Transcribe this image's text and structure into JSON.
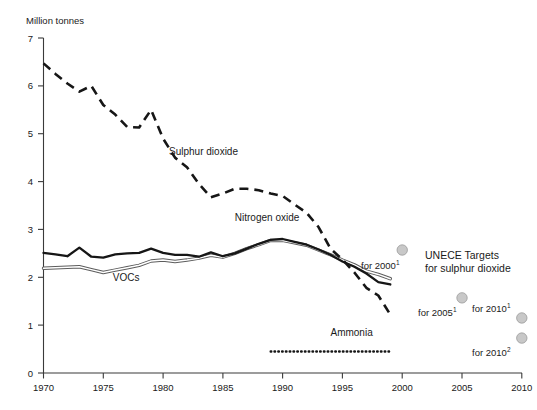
{
  "chart_data": {
    "type": "line",
    "title": "",
    "ylabel": "Million tonnes",
    "xlabel": "",
    "xlim": [
      1970,
      2010
    ],
    "ylim": [
      0,
      7
    ],
    "grid": false,
    "legend_position": "inline-annotations",
    "x_ticks": [
      "1970",
      "1975",
      "1980",
      "1985",
      "1990",
      "1995",
      "2000",
      "2005",
      "2010"
    ],
    "y_ticks": [
      "0",
      "1",
      "2",
      "3",
      "4",
      "5",
      "6",
      "7"
    ],
    "series": [
      {
        "name": "Sulphur dioxide",
        "style": "dashed",
        "color": "#161616",
        "x": [
          1970,
          1971,
          1972,
          1973,
          1974,
          1975,
          1976,
          1977,
          1978,
          1979,
          1980,
          1981,
          1982,
          1983,
          1984,
          1985,
          1986,
          1987,
          1988,
          1989,
          1990,
          1991,
          1992,
          1993,
          1994,
          1995,
          1996,
          1997,
          1998,
          1999
        ],
        "values": [
          6.47,
          6.25,
          6.05,
          5.88,
          6.0,
          5.6,
          5.4,
          5.14,
          5.13,
          5.5,
          4.9,
          4.5,
          4.3,
          3.95,
          3.67,
          3.75,
          3.85,
          3.85,
          3.82,
          3.75,
          3.7,
          3.52,
          3.35,
          3.05,
          2.6,
          2.37,
          2.1,
          1.78,
          1.62,
          1.22
        ]
      },
      {
        "name": "Nitrogen oxide",
        "style": "solid",
        "color": "#161616",
        "x": [
          1970,
          1971,
          1972,
          1973,
          1974,
          1975,
          1976,
          1977,
          1978,
          1979,
          1980,
          1981,
          1982,
          1983,
          1984,
          1985,
          1986,
          1987,
          1988,
          1989,
          1990,
          1991,
          1992,
          1993,
          1994,
          1995,
          1996,
          1997,
          1998,
          1999
        ],
        "values": [
          2.51,
          2.48,
          2.44,
          2.62,
          2.43,
          2.41,
          2.48,
          2.5,
          2.51,
          2.6,
          2.51,
          2.47,
          2.47,
          2.43,
          2.52,
          2.44,
          2.5,
          2.6,
          2.7,
          2.78,
          2.8,
          2.74,
          2.68,
          2.58,
          2.47,
          2.33,
          2.22,
          2.08,
          1.9,
          1.85
        ]
      },
      {
        "name": "VOCs",
        "style": "solid-outline",
        "color": "#5c5c5c",
        "x": [
          1970,
          1971,
          1972,
          1973,
          1974,
          1975,
          1976,
          1977,
          1978,
          1979,
          1980,
          1981,
          1982,
          1983,
          1984,
          1985,
          1986,
          1987,
          1988,
          1989,
          1990,
          1991,
          1992,
          1993,
          1994,
          1995,
          1996,
          1997,
          1998,
          1999
        ],
        "values": [
          2.19,
          2.2,
          2.21,
          2.22,
          2.16,
          2.1,
          2.15,
          2.2,
          2.25,
          2.34,
          2.36,
          2.33,
          2.36,
          2.4,
          2.46,
          2.42,
          2.5,
          2.6,
          2.68,
          2.77,
          2.77,
          2.72,
          2.67,
          2.57,
          2.47,
          2.36,
          2.26,
          2.13,
          2.06,
          1.97
        ]
      },
      {
        "name": "Ammonia",
        "style": "dotted",
        "color": "#161616",
        "x": [
          1989,
          1999
        ],
        "values": [
          0.45,
          0.45
        ]
      }
    ],
    "targets": [
      {
        "label": "for 2000",
        "footnote": "1",
        "x": 2000,
        "value": 2.57,
        "color": "#c8c8c8"
      },
      {
        "label": "for 2005",
        "footnote": "1",
        "x": 2005,
        "value": 1.57,
        "color": "#c8c8c8"
      },
      {
        "label": "for 2010",
        "footnote": "1",
        "x": 2010,
        "value": 1.15,
        "color": "#c8c8c8"
      },
      {
        "label": "for 2010",
        "footnote": "2",
        "x": 2010,
        "value": 0.73,
        "color": "#c8c8c8"
      }
    ],
    "annotations": [
      {
        "text": "Sulphur dioxide",
        "x": 1980.5,
        "y": 4.55
      },
      {
        "text": "Nitrogen oxide",
        "x": 1986.0,
        "y": 3.17
      },
      {
        "text": "VOCs",
        "x": 1975.8,
        "y": 1.93
      },
      {
        "text": "Ammonia",
        "x": 1994.0,
        "y": 0.78
      }
    ],
    "legend": {
      "line1": "UNECE Targets",
      "line2": "for sulphur dioxide"
    }
  }
}
